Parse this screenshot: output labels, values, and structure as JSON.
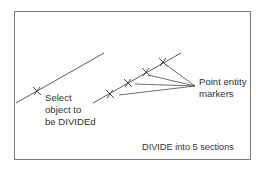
{
  "diagram": {
    "colors": {
      "line": "#4a4a4a",
      "frame": "#7a7a7a",
      "text": "#333333",
      "background": "#ffffff"
    },
    "labels": {
      "select_object": [
        "Select",
        "object to",
        "be DIVIDEd"
      ],
      "point_markers": [
        "Point entity",
        "markers"
      ],
      "caption": "DIVIDE into 5 sections"
    },
    "divisions": 5,
    "marker_icon": "x-cross",
    "left_line": {
      "from": [
        16,
        103
      ],
      "to": [
        104,
        53
      ],
      "pick_marker": [
        37,
        91
      ]
    },
    "right_line": {
      "from": [
        93,
        103
      ],
      "to": [
        181,
        53
      ],
      "markers": [
        [
          110,
          94
        ],
        [
          128,
          83
        ],
        [
          146,
          72
        ],
        [
          163,
          62
        ]
      ]
    },
    "leader_origin": [
      195,
      86
    ]
  }
}
